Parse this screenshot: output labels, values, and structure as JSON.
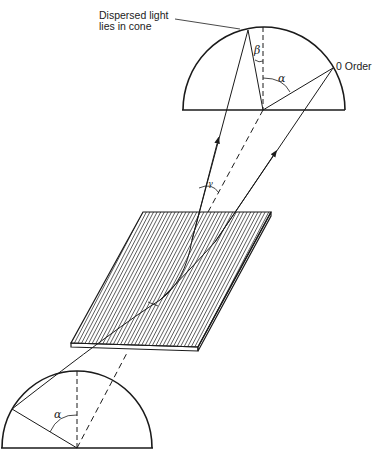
{
  "diagram": {
    "labels": {
      "dispersed_line1": "Dispersed light",
      "dispersed_line2": "lies in cone",
      "zero_order": "0 Order",
      "alpha_top": "α",
      "beta": "β",
      "gamma": "γ",
      "alpha_bottom": "α",
      "gamma_small": "γ"
    },
    "colors": {
      "ink": "#1a1a1a",
      "background": "#ffffff"
    }
  }
}
